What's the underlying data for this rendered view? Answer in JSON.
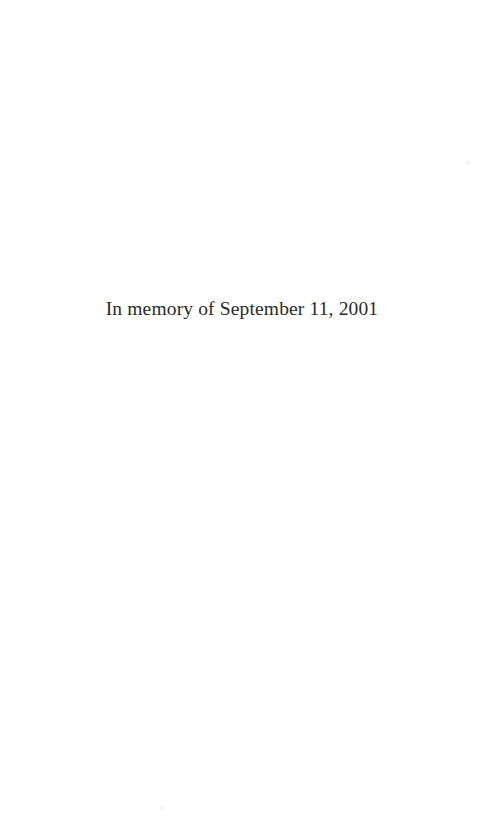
{
  "page": {
    "kind": "book-dedication-page",
    "background_color": "#ffffff",
    "text_color": "#2b2b2b",
    "width": 484,
    "height": 821
  },
  "dedication": {
    "line": "In memory of September 11, 2001"
  },
  "artifacts": {
    "speck_color": "#f4f4f4",
    "speck_one_label": "scan-speck-upper-right",
    "speck_two_label": "scan-speck-lower-left"
  }
}
